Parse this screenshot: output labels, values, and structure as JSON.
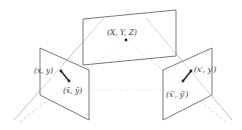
{
  "diagram": {
    "title": "",
    "labels": {
      "world_point": "(X, Y, Z)",
      "left_point": "(x, y)",
      "left_point_bar": "(x̄, ȳ)",
      "right_point": "(x′, y′)",
      "right_point_bar": "(x̄′, ȳ′)"
    },
    "colors": {
      "plane_stroke": "#555555",
      "ray": "#bbbbbb",
      "dashed_ray": "#cccccc",
      "point": "#222222"
    }
  }
}
